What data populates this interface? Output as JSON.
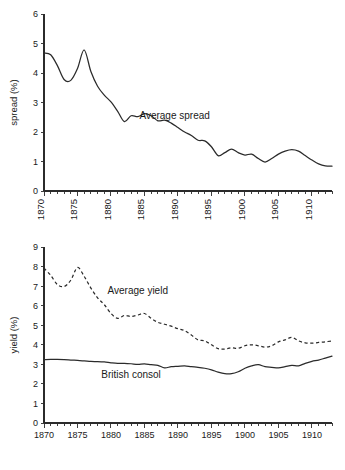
{
  "chart_data": [
    {
      "type": "line",
      "title": "",
      "panel": "top",
      "xlabel": "",
      "ylabel": "spread (%)",
      "xlim": [
        1870,
        1913
      ],
      "ylim": [
        0,
        6
      ],
      "yticks": [
        0,
        1,
        2,
        3,
        4,
        5,
        6
      ],
      "xticks": [
        1870,
        1875,
        1880,
        1885,
        1890,
        1895,
        1900,
        1905,
        1910
      ],
      "xtick_rotation": 90,
      "minor_xticks": "annual",
      "grid": false,
      "legend": "none",
      "annotations": [
        {
          "text": "Average spread",
          "x": 1889.5,
          "y": 2.45
        }
      ],
      "series": [
        {
          "name": "Average spread",
          "style": "solid",
          "x": [
            1870,
            1871,
            1872,
            1873,
            1874,
            1875,
            1876,
            1877,
            1878,
            1879,
            1880,
            1881,
            1882,
            1883,
            1884,
            1885,
            1886,
            1887,
            1888,
            1889,
            1890,
            1891,
            1892,
            1893,
            1894,
            1895,
            1896,
            1897,
            1898,
            1899,
            1900,
            1901,
            1902,
            1903,
            1904,
            1905,
            1906,
            1907,
            1908,
            1909,
            1910,
            1911,
            1912,
            1913
          ],
          "values": [
            4.68,
            4.62,
            4.25,
            3.78,
            3.75,
            4.15,
            4.78,
            4.05,
            3.55,
            3.25,
            3.02,
            2.7,
            2.35,
            2.55,
            2.52,
            2.62,
            2.55,
            2.38,
            2.4,
            2.3,
            2.15,
            2.0,
            1.88,
            1.72,
            1.7,
            1.5,
            1.2,
            1.3,
            1.42,
            1.3,
            1.22,
            1.25,
            1.1,
            0.98,
            1.1,
            1.25,
            1.35,
            1.4,
            1.35,
            1.2,
            1.05,
            0.92,
            0.85,
            0.84
          ]
        }
      ]
    },
    {
      "type": "line",
      "title": "",
      "panel": "bottom",
      "xlabel": "",
      "ylabel": "yield (%)",
      "xlim": [
        1870,
        1913
      ],
      "ylim": [
        0,
        9
      ],
      "yticks": [
        0,
        1,
        2,
        3,
        4,
        5,
        6,
        7,
        8,
        9
      ],
      "xticks": [
        1870,
        1875,
        1880,
        1885,
        1890,
        1895,
        1900,
        1905,
        1910
      ],
      "xtick_rotation": 0,
      "minor_xticks": "annual",
      "grid": false,
      "legend": "none",
      "annotations": [
        {
          "text": "Average yield",
          "x": 1884.0,
          "y": 6.6
        },
        {
          "text": "British consol",
          "x": 1883.0,
          "y": 2.3
        }
      ],
      "series": [
        {
          "name": "Average yield",
          "style": "dashed",
          "x": [
            1870,
            1871,
            1872,
            1873,
            1874,
            1875,
            1876,
            1877,
            1878,
            1879,
            1880,
            1881,
            1882,
            1883,
            1884,
            1885,
            1886,
            1887,
            1888,
            1889,
            1890,
            1891,
            1892,
            1893,
            1894,
            1895,
            1896,
            1897,
            1898,
            1899,
            1900,
            1901,
            1902,
            1903,
            1904,
            1905,
            1906,
            1907,
            1908,
            1909,
            1910,
            1911,
            1912,
            1913
          ],
          "values": [
            7.92,
            7.55,
            7.08,
            6.98,
            7.3,
            7.95,
            7.5,
            6.9,
            6.4,
            6.05,
            5.6,
            5.35,
            5.5,
            5.45,
            5.52,
            5.6,
            5.35,
            5.15,
            5.05,
            4.95,
            4.82,
            4.72,
            4.5,
            4.25,
            4.2,
            4.0,
            3.8,
            3.78,
            3.85,
            3.82,
            3.95,
            4.0,
            3.95,
            3.88,
            3.95,
            4.15,
            4.25,
            4.38,
            4.2,
            4.1,
            4.08,
            4.12,
            4.15,
            4.2
          ]
        },
        {
          "name": "British consol",
          "style": "solid",
          "x": [
            1870,
            1871,
            1872,
            1873,
            1874,
            1875,
            1876,
            1877,
            1878,
            1879,
            1880,
            1881,
            1882,
            1883,
            1884,
            1885,
            1886,
            1887,
            1888,
            1889,
            1890,
            1891,
            1892,
            1893,
            1894,
            1895,
            1896,
            1897,
            1898,
            1899,
            1900,
            1901,
            1902,
            1903,
            1904,
            1905,
            1906,
            1907,
            1908,
            1909,
            1910,
            1911,
            1912,
            1913
          ],
          "values": [
            3.24,
            3.25,
            3.25,
            3.24,
            3.22,
            3.2,
            3.18,
            3.15,
            3.14,
            3.12,
            3.08,
            3.05,
            3.05,
            3.03,
            3.0,
            3.02,
            2.98,
            2.95,
            2.82,
            2.88,
            2.9,
            2.92,
            2.88,
            2.85,
            2.8,
            2.72,
            2.6,
            2.52,
            2.52,
            2.62,
            2.8,
            2.92,
            2.98,
            2.88,
            2.85,
            2.82,
            2.88,
            2.95,
            2.92,
            3.05,
            3.15,
            3.22,
            3.32,
            3.42
          ]
        }
      ]
    }
  ]
}
